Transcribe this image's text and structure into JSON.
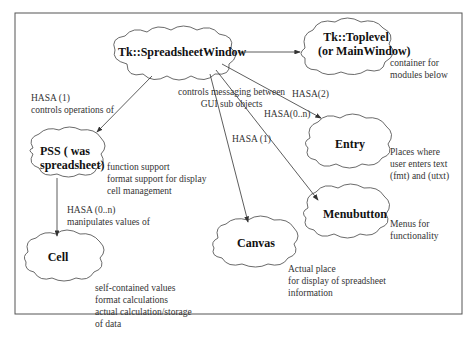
{
  "diagram": {
    "nodes": {
      "spreadsheet_window": {
        "label": "Tk::SpreadsheetWindow"
      },
      "toplevel": {
        "line1": "Tk::Toplevel",
        "line2": "(or MainWindow)",
        "note": [
          "container for",
          "modules below"
        ]
      },
      "pss": {
        "line1": "PSS ( was",
        "line2": "spreadsheet)",
        "note": [
          "function support",
          "format support for display",
          "cell management"
        ]
      },
      "entry": {
        "label": "Entry",
        "note": [
          "Places where",
          "user enters text",
          "(fmt) and (utxt)"
        ]
      },
      "menubutton": {
        "label": "Menubutton",
        "note": [
          "Menus for",
          "functionality"
        ]
      },
      "canvas": {
        "label": "Canvas",
        "note": [
          "Actual place",
          "for display of  spreadsheet",
          "information"
        ]
      },
      "cell": {
        "label": "Cell",
        "note": [
          "self-contained values",
          "format calculations",
          "actual calculation/storage",
          "of data"
        ]
      }
    },
    "edges": {
      "to_pss": {
        "line1": "HASA (1)",
        "line2": "controls operations of"
      },
      "messaging": {
        "line1": "controls messaging between",
        "line2": "GUI sub objects"
      },
      "to_entry": {
        "label": "HASA(2)"
      },
      "to_menubutton": {
        "label": "HASA(0..n)"
      },
      "to_canvas": {
        "label": "HASA (1)"
      },
      "to_cell": {
        "line1": "HASA (0..n)",
        "line2": "manipulates values of"
      }
    },
    "colors": {
      "stroke": "#444444",
      "frame": "#555555",
      "background": "#ffffff"
    }
  }
}
